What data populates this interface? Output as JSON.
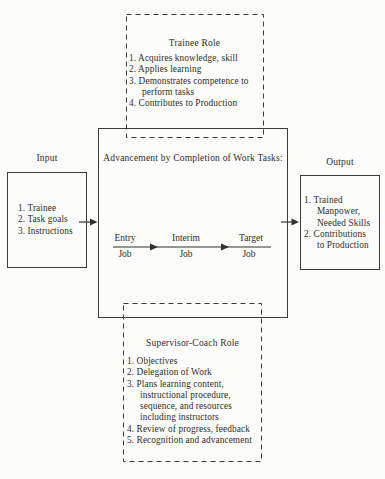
{
  "palette": {
    "paper": "#fcfcfa",
    "ink": "#2f2d29",
    "line": "#3d3b36"
  },
  "trainee_role": {
    "title": "Trainee Role",
    "items": [
      "1. Acquires knowledge, skill",
      "2. Applies learning",
      "3. Demonstrates competence to\nperform tasks",
      "4. Contributes to Production"
    ]
  },
  "input": {
    "title": "Input",
    "items": [
      "1. Trainee",
      "2. Task goals",
      "3. Instructions"
    ]
  },
  "center": {
    "title": "Advancement by Completion of Work Tasks:",
    "stages": [
      {
        "top": "Entry",
        "bottom": "Job"
      },
      {
        "top": "Interim",
        "bottom": "Job"
      },
      {
        "top": "Target",
        "bottom": "Job"
      }
    ]
  },
  "output": {
    "title": "Output",
    "items": [
      "1. Trained\nManpower,\nNeeded Skills",
      "2. Contributions\nto Production"
    ]
  },
  "supervisor_role": {
    "title": "Supervisor-Coach Role",
    "items": [
      "1. Objectives",
      "2. Delegation of Work",
      "3. Plans learning content,\ninstructional procedure,\nsequence, and resources\nincluding instructors",
      "4. Review of progress, feedback",
      "5. Recognition and advancement"
    ]
  }
}
